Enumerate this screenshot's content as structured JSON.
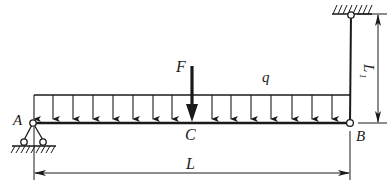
{
  "diagram": {
    "type": "beam-with-distributed-load",
    "colors": {
      "ink": "#1a1a1a",
      "background": "#ffffff"
    },
    "labels": {
      "point_a": "A",
      "point_b": "B",
      "point_c": "C",
      "force": "F",
      "distributed_load": "q",
      "span_length": "L",
      "rod_length_main": "L",
      "rod_length_sub": "1"
    },
    "elements": {
      "beam": "horizontal beam AB",
      "support_a": "pinned roller support at A",
      "rod": "vertical pin-ended rod from B to fixed ceiling",
      "load": "uniform distributed load q over AB",
      "point_force": "concentrated force F at C (midspan)",
      "dimension_l": "span length L from A to B",
      "dimension_l1": "rod length L1"
    }
  }
}
